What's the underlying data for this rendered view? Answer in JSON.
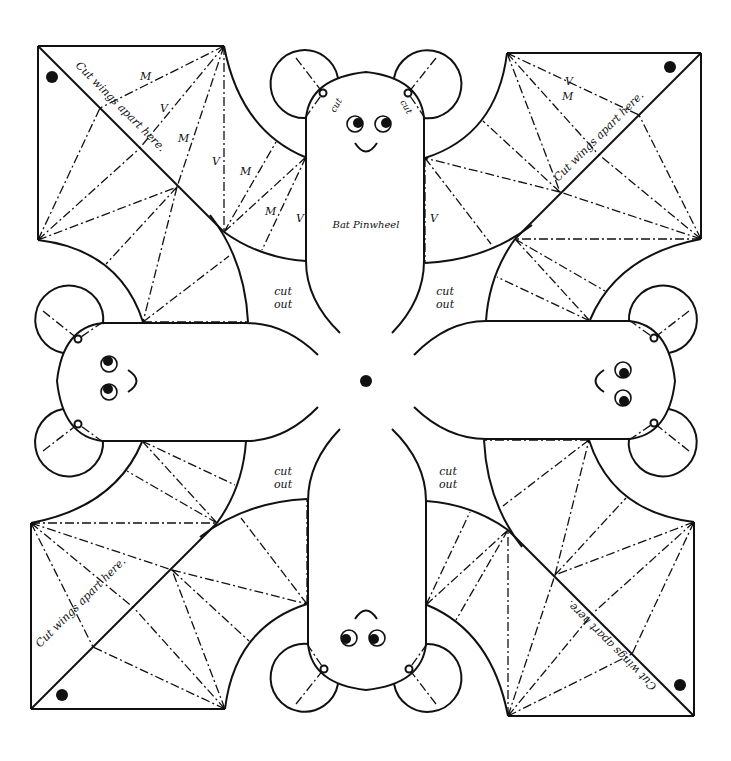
{
  "title": "Bat Pinwheel",
  "labels": {
    "cut_wings": "Cut wings apart here.",
    "cut": "cut",
    "cut_out_1": "cut",
    "cut_out_2": "out",
    "mountain": "M",
    "valley": "V"
  },
  "colors": {
    "line": "#111111",
    "background": "#ffffff"
  },
  "symmetry": {
    "type": "rotational",
    "order": 4,
    "center": [
      366,
      381
    ]
  },
  "fold_legend": {
    "M": "mountain fold",
    "V": "valley fold"
  }
}
